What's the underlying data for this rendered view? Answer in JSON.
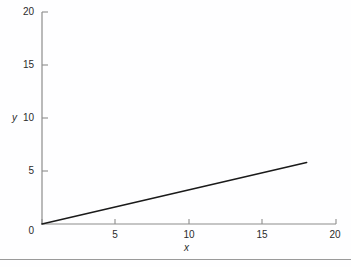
{
  "chart_data": {
    "type": "line",
    "title": "",
    "subtitle": "",
    "xlabel": "x",
    "ylabel": "y",
    "xlim": [
      0,
      20
    ],
    "ylim": [
      0,
      20
    ],
    "xticks": [
      0,
      5,
      10,
      15,
      20
    ],
    "yticks": [
      0,
      5,
      10,
      15,
      20
    ],
    "xtick_labels": [
      "0",
      "5",
      "10",
      "15",
      "20"
    ],
    "ytick_labels": [
      "0",
      "5",
      "10",
      "15",
      "20"
    ],
    "grid": false,
    "legend": null,
    "legend_position": "none",
    "annotations": [],
    "series": [
      {
        "name": "line",
        "color": "#1a1a1a",
        "line_width": 1.6,
        "x": [
          0,
          18
        ],
        "y": [
          0,
          5.8
        ],
        "slope": 0.322,
        "intercept": 0
      }
    ]
  },
  "axes": {
    "axis_color": "#8c8c8c",
    "tick_color": "#8c8c8c",
    "label_color": "#2b2b2b"
  },
  "page": {
    "background": "#ffffff",
    "rule_color": "#9a9a9a"
  }
}
